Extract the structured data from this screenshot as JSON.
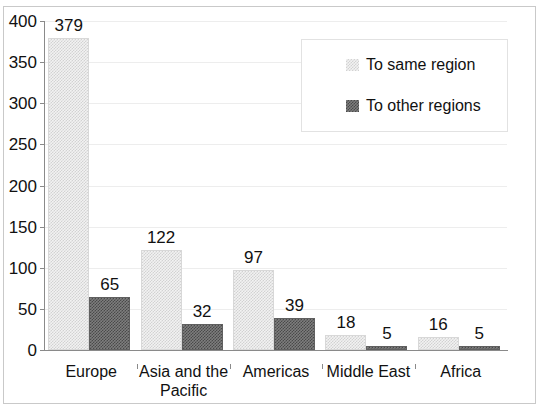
{
  "chart_data": {
    "type": "bar",
    "title": "",
    "subtitle": "",
    "xlabel": "",
    "ylabel": "",
    "categories": [
      "Europe",
      "Asia and the\nPacific",
      "Americas",
      "Middle East",
      "Africa"
    ],
    "series": [
      {
        "name": "To same region",
        "key": "same",
        "color": "#e8e8e8",
        "values": [
          379,
          122,
          97,
          18,
          16
        ]
      },
      {
        "name": "To other regions",
        "key": "other",
        "color": "#6b6b6b",
        "values": [
          65,
          32,
          39,
          5,
          5
        ]
      }
    ],
    "ylim": [
      0,
      400
    ],
    "yticks": [
      0,
      50,
      100,
      150,
      200,
      250,
      300,
      350,
      400
    ],
    "ytick_labels": [
      "0",
      "50",
      "100",
      "150",
      "200",
      "250",
      "300",
      "350",
      "400"
    ],
    "grid": true,
    "grid_axis": "y",
    "data_labels": true,
    "legend": {
      "position": "top-right",
      "entries": [
        {
          "label": "To same region",
          "swatch": "light-checker-swatch"
        },
        {
          "label": "To other regions",
          "swatch": "dark-checker-swatch"
        }
      ]
    }
  }
}
